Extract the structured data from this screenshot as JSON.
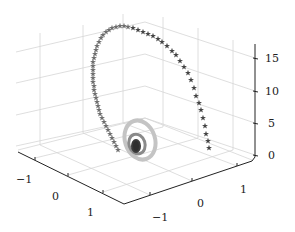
{
  "chart_data": {
    "type": "scatter3d",
    "title": "",
    "marker": "star",
    "colormap": "grayscale",
    "xlabel": "",
    "ylabel": "",
    "zlabel": "",
    "x_ticks": [
      "−1",
      "0",
      "1"
    ],
    "y_ticks": [
      "−1",
      "0",
      "1"
    ],
    "z_ticks": [
      "0",
      "5",
      "10",
      "15"
    ],
    "xlim": [
      -1.5,
      1.5
    ],
    "ylim": [
      -1.5,
      1.5
    ],
    "zlim": [
      0,
      18
    ],
    "grid": true,
    "legend": null,
    "series": [
      {
        "name": "spiral",
        "equation_hint": "x = r(t)·cos t, y = r(t)·sin t, z = f(t), radius growing with t",
        "z_range": [
          0,
          17.5
        ],
        "color_range": [
          "#333333",
          "#bbbbbb",
          "#444444"
        ]
      }
    ]
  },
  "axes": {
    "z": {
      "ticks": [
        {
          "label": "15",
          "y": 58
        },
        {
          "label": "10",
          "y": 91
        },
        {
          "label": "5",
          "y": 123
        },
        {
          "label": "0",
          "y": 155
        }
      ]
    },
    "left": {
      "ticks": [
        {
          "label": "−1",
          "x": 16,
          "y": 174
        },
        {
          "label": "0",
          "x": 52,
          "y": 191
        },
        {
          "label": "1",
          "x": 87,
          "y": 207
        }
      ]
    },
    "right": {
      "ticks": [
        {
          "label": "−1",
          "x": 152,
          "y": 212
        },
        {
          "label": "0",
          "x": 197,
          "y": 198
        },
        {
          "label": "1",
          "x": 240,
          "y": 184
        }
      ]
    }
  },
  "colors": {
    "grid": "#d4d4d4",
    "axis": "#222222",
    "star_dark": "#444444",
    "star_mid": "#6e6e6e",
    "coil_light": "#bdbdbd",
    "coil_dark": "#2e2e2e"
  }
}
